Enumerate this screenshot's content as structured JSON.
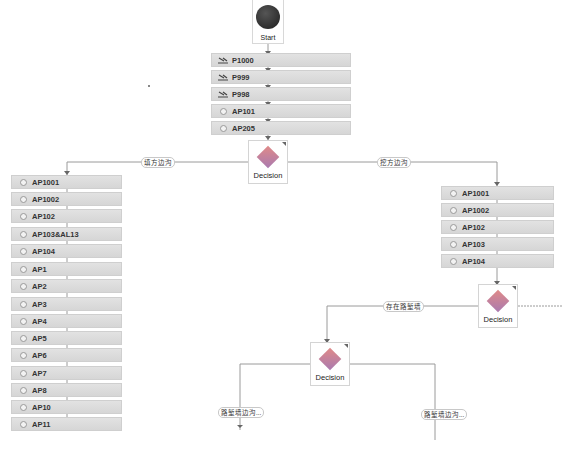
{
  "start": {
    "label": "Start"
  },
  "main_sequence": [
    {
      "label": "P1000",
      "icon": "tool-icon"
    },
    {
      "label": "P999",
      "icon": "tool-icon"
    },
    {
      "label": "P998",
      "icon": "tool-icon"
    },
    {
      "label": "AP101",
      "icon": "ring-icon"
    },
    {
      "label": "AP205",
      "icon": "ring-icon"
    }
  ],
  "decision_1": {
    "label": "Decision"
  },
  "branch_labels": {
    "left": "填方边沟",
    "right": "挖方边沟"
  },
  "left_sequence": [
    {
      "label": "AP1001"
    },
    {
      "label": "AP1002"
    },
    {
      "label": "AP102"
    },
    {
      "label": "AP103&AL13"
    },
    {
      "label": "AP104"
    },
    {
      "label": "AP1"
    },
    {
      "label": "AP2"
    },
    {
      "label": "AP3"
    },
    {
      "label": "AP4"
    },
    {
      "label": "AP5"
    },
    {
      "label": "AP6"
    },
    {
      "label": "AP7"
    },
    {
      "label": "AP8"
    },
    {
      "label": "AP10"
    },
    {
      "label": "AP11"
    }
  ],
  "right_sequence": [
    {
      "label": "AP1001"
    },
    {
      "label": "AP1002"
    },
    {
      "label": "AP102"
    },
    {
      "label": "AP103"
    },
    {
      "label": "AP104"
    }
  ],
  "decision_2": {
    "label": "Decision"
  },
  "decision_2_branch": {
    "label": "存在路堑墙"
  },
  "decision_3": {
    "label": "Decision"
  },
  "decision_3_branches": {
    "left": "路堑墙边沟...",
    "right": "路堑墙边沟..."
  }
}
